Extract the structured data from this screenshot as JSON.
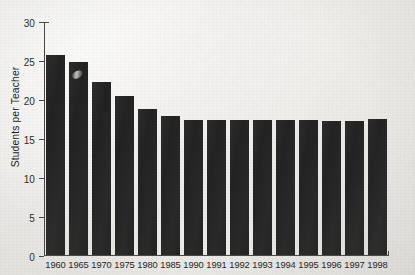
{
  "chart_data": {
    "type": "bar",
    "title": "",
    "xlabel": "",
    "ylabel": "Students per Teacher",
    "categories": [
      "1960",
      "1965",
      "1970",
      "1975",
      "1980",
      "1985",
      "1990",
      "1991",
      "1992",
      "1993",
      "1994",
      "1995",
      "1996",
      "1997",
      "1998"
    ],
    "values": [
      25.8,
      24.8,
      22.3,
      20.4,
      18.8,
      17.9,
      17.3,
      17.4,
      17.4,
      17.4,
      17.3,
      17.3,
      17.2,
      17.2,
      17.5
    ],
    "ylim": [
      0,
      30
    ],
    "yticks": [
      0,
      5,
      10,
      15,
      20,
      25,
      30
    ],
    "ytick_labels": [
      "0",
      "5",
      "10",
      "15",
      "20",
      "25",
      "30"
    ],
    "grid": false,
    "legend": null,
    "series": [
      {
        "name": "Students per Teacher",
        "color": "#232323",
        "values": [
          25.8,
          24.8,
          22.3,
          20.4,
          18.8,
          17.9,
          17.3,
          17.4,
          17.4,
          17.4,
          17.3,
          17.3,
          17.2,
          17.2,
          17.5
        ]
      }
    ]
  },
  "figure": {
    "background_color": "#efeeec",
    "axis_color": "#4a4742",
    "bar_color": "#232323",
    "tick_label_color": "#2c2a27"
  }
}
